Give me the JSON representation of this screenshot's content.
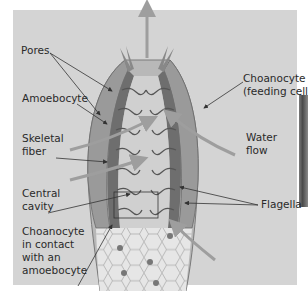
{
  "figure": {
    "labels": {
      "pores": "Pores",
      "amoebocyte": "Amoebocyte",
      "skeletal_fiber": [
        "Skeletal",
        "fiber"
      ],
      "central_cavity": [
        "Central",
        "cavity"
      ],
      "choanocyte_contact": [
        "Choanocyte",
        "in contact",
        "with an",
        "amoebocyte"
      ],
      "choanocyte_feeding": [
        "Choanocyte",
        "(feeding cell)"
      ],
      "water_flow": [
        "Water",
        "flow"
      ],
      "flagella": "Flagella"
    },
    "colors": {
      "background": "#d4d4d4",
      "outer_wall": "#9a9a9a",
      "inner_wall": "#6e6e6e",
      "arrow": "#9e9e9e",
      "leader_line": "#333333",
      "base_mesh": "#e6e6e6"
    }
  }
}
